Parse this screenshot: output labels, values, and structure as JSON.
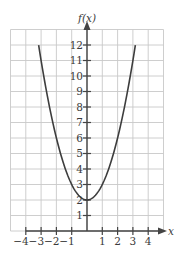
{
  "chart_data": {
    "type": "line",
    "title": "",
    "function": "f(x) = x^2 + 2",
    "xlabel": "x",
    "ylabel": "f(x)",
    "xlim": [
      -5,
      5
    ],
    "ylim": [
      0,
      13
    ],
    "grid": true,
    "x_ticks": [
      -4,
      -3,
      -2,
      -1,
      1,
      2,
      3,
      4
    ],
    "x_tick_labels": [
      "−4",
      "−3",
      "−2",
      "−1",
      "1",
      "2",
      "3",
      "4"
    ],
    "y_ticks": [
      1,
      2,
      3,
      4,
      5,
      6,
      7,
      8,
      9,
      10,
      11,
      12
    ],
    "y_tick_labels": [
      "1",
      "2",
      "3",
      "4",
      "5",
      "6",
      "7",
      "8",
      "9",
      "10",
      "11",
      "12"
    ],
    "series": [
      {
        "name": "f(x)",
        "domain": [
          -3.16,
          3.16
        ],
        "x": [
          -3.16,
          -3,
          -2.5,
          -2,
          -1.5,
          -1,
          -0.5,
          0,
          0.5,
          1,
          1.5,
          2,
          2.5,
          3,
          3.16
        ],
        "y": [
          12,
          11,
          8.25,
          6,
          4.25,
          3,
          2.25,
          2,
          2.25,
          3,
          4.25,
          6,
          8.25,
          11,
          12
        ]
      }
    ],
    "vertex": {
      "x": 0,
      "y": 2
    },
    "colors": {
      "curve": "#3d3d3d",
      "axis": "#444444",
      "grid": "#c8c8c8"
    }
  }
}
